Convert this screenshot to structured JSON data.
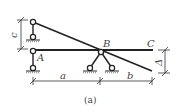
{
  "figure": {
    "caption": "(a)",
    "labels": {
      "A": "A",
      "B": "B",
      "C": "C",
      "a": "a",
      "b": "b",
      "c": "c",
      "delta": "Δ"
    },
    "colors": {
      "line": "#222222",
      "text": "#444444",
      "background": "#ffffff"
    }
  }
}
